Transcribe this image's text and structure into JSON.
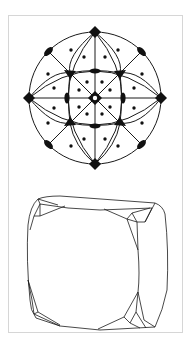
{
  "figure": {
    "panels": [
      {
        "name": "stereographic-projection",
        "description": "Stereographic projection of cubic point group symmetry elements (m3m)",
        "symbols": {
          "center": "4-fold axis (open square)",
          "diamonds": "4-fold axes",
          "triangles": "3-fold axes",
          "ellipses": "2-fold axes",
          "dots": "general face poles"
        },
        "counts": {
          "diamonds": 4,
          "triangles": 4,
          "ellipses": 8,
          "dots": 24
        }
      },
      {
        "name": "crystal-drawing",
        "description": "Crystal habit drawing: rounded cube with small facets at the corners"
      }
    ],
    "colors": {
      "line": "#1a1a1a",
      "frame": "#d6d6d6",
      "background": "#ffffff"
    }
  }
}
